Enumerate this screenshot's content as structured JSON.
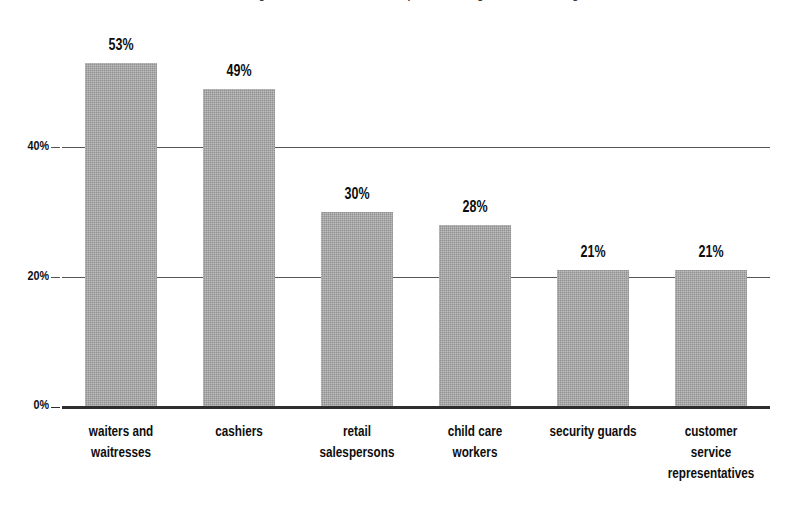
{
  "chart_data": {
    "type": "bar",
    "title": "Percentage of workers in selected occupations earning near minimum wage",
    "subtitle": "",
    "xlabel": "",
    "ylabel": "",
    "categories": [
      "waiters and\nwaitresses",
      "cashiers",
      "retail\nsalespersons",
      "child care\nworkers",
      "security guards",
      "customer\nservice\nrepresentatives"
    ],
    "values": [
      53,
      49,
      30,
      28,
      21,
      21
    ],
    "value_labels": [
      "53%",
      "49%",
      "30%",
      "28%",
      "21%",
      "21%"
    ],
    "ylim": [
      0,
      60
    ],
    "yticks": [
      0,
      20,
      40
    ],
    "ytick_labels": [
      "0%",
      "20%",
      "40%"
    ],
    "grid": true,
    "legend": false,
    "legend_position": "none",
    "colors": {
      "bar_fill": "#a3a3a3",
      "axis": "#2e2e2e",
      "gridline": "#555555",
      "text": "#0d0d0d",
      "background": "#ffffff"
    }
  }
}
